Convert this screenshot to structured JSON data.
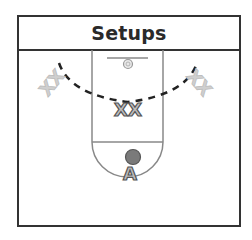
{
  "title": "Setups",
  "diagram": {
    "type": "basketball-half-court-setup",
    "lane": {
      "stroke": "#888888"
    },
    "ball": {
      "color": "#7a7a7a",
      "stroke": "#555555"
    },
    "players": [
      {
        "id": "left-wing",
        "label": "XX",
        "style": "faded",
        "color": "#c8c8c8"
      },
      {
        "id": "right-wing",
        "label": "XX",
        "style": "faded",
        "color": "#c8c8c8"
      },
      {
        "id": "high-post",
        "label": "XX",
        "style": "outlined",
        "color": "#b8b8b8"
      },
      {
        "id": "point",
        "label": "A",
        "style": "outlined",
        "color": "#b8b8b8"
      }
    ],
    "arc": {
      "style": "dashed",
      "color": "#222222"
    }
  },
  "colors": {
    "frame": "#333333",
    "title_text": "#2a2a2a"
  }
}
